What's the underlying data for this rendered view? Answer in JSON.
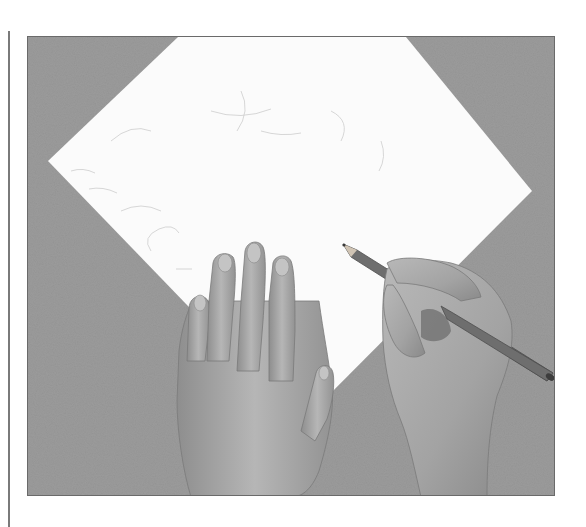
{
  "figure": {
    "alt": "Photograph of two hands on a white sheet of paper placed diagonally on a gray textured surface; the right hand holds a pencil drawing faint sketch lines while the left hand steadies the paper.",
    "colors": {
      "background_surface": "#9b9b9b",
      "paper": "#fbfbfb",
      "skin_light": "#b9b9b9",
      "skin_mid": "#a4a4a4",
      "skin_shadow": "#7e7e7e",
      "pencil": "#6e6e6e",
      "pencil_tip": "#3a3a3a",
      "rule_line": "#7a7a7a",
      "sketch_lines": "#c8c8c8"
    },
    "elements": [
      "left-rule",
      "photo-frame",
      "gray-surface",
      "white-paper",
      "left-hand",
      "right-hand",
      "pencil",
      "sketch-marks"
    ]
  }
}
